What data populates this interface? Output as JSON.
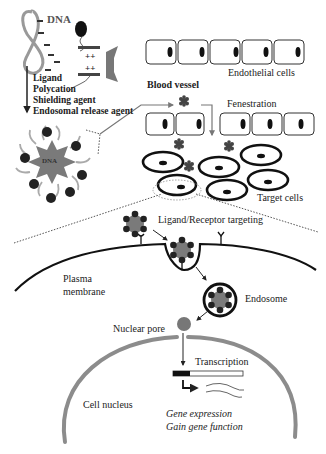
{
  "vector_panel": {
    "dna_label": "DNA",
    "components": [
      "Ligand",
      "Polycation",
      "Shielding agent",
      "Endosomal release agent"
    ],
    "charges_minus": "−",
    "charges_plus": "++",
    "nanoparticle_core_label": "DNA"
  },
  "vessel_panel": {
    "endothelial_label": "Endothelial cells",
    "blood_vessel_label": "Blood vessel",
    "fenestration_label": "Fenestration",
    "target_cells_label": "Target cells"
  },
  "cell_panel": {
    "targeting_label": "Ligand/Receptor targeting",
    "plasma_membrane_label_line1": "Plasma",
    "plasma_membrane_label_line2": "membrane",
    "endosome_label": "Endosome",
    "nuclear_pore_label": "Nuclear pore",
    "transcription_label": "Transcription",
    "nucleus_label": "Cell nucleus",
    "outcome_line1": "Gene expression",
    "outcome_line2": "Gain gene function"
  },
  "colors": {
    "ink": "#222222",
    "gray_fill": "#7a7a7a",
    "light_gray": "#a8a8a8",
    "nucleus_membrane": "#8c8c8c"
  }
}
